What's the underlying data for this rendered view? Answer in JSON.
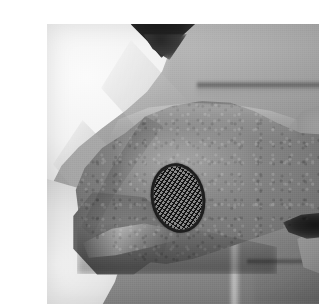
{
  "document": {
    "kind": "photograph",
    "colorspace": "grayscale",
    "width": 319,
    "height": 305,
    "page_background": "#ffffff",
    "caption": ""
  },
  "photo": {
    "frame": {
      "left": 7,
      "top": 8,
      "width": 303,
      "height": 280,
      "border": "none"
    },
    "subject": "bare arm bent at the elbow, seen from the side, with an oval mesh-patterned patch applied to the skin over the elbow",
    "scene_description": "Close-up black-and-white photograph of a person's bent arm. A white garment sleeve fills the upper-left corner and a light garment area the lower-left. A dark triangular shadow of hair or head appears at the top edge. The background is an out-of-focus light grey wall crossed by two horizontal dark rails and one vertical light post.",
    "tones": {
      "background_light": "#b9b9b9",
      "background_dark": "#7e7e7e",
      "skin_light": "#9d9d9d",
      "skin_mid": "#7a7a7a",
      "skin_dark": "#525252",
      "garment_white": "#fbfbfb",
      "hair_dark": "#1b1b1b"
    },
    "elements": [
      {
        "name": "white-sleeve",
        "label": "White sleeve / garment",
        "region": "upper-left"
      },
      {
        "name": "dark-hair-shadow",
        "label": "Dark hair / head shadow",
        "region": "top-center"
      },
      {
        "name": "arm",
        "label": "Bare upper arm and elbow",
        "region": "center"
      },
      {
        "name": "forearm",
        "label": "Forearm continuing to the right past the elbow crease",
        "region": "right"
      },
      {
        "name": "elbow-crease-shadow",
        "label": "Dark elbow crease shadow",
        "region": "right-of-center"
      },
      {
        "name": "lower-garment",
        "label": "Light garment area",
        "region": "lower-left"
      },
      {
        "name": "background-rail-upper",
        "label": "Upper horizontal background rail",
        "region": "upper-right"
      },
      {
        "name": "background-rail-lower",
        "label": "Lower horizontal background rail",
        "region": "lower-right"
      },
      {
        "name": "background-post",
        "label": "Vertical light background post",
        "region": "lower-center-right"
      }
    ]
  },
  "patch": {
    "label": "Oval mesh patch on skin",
    "shape": "ellipse",
    "center_x": 138,
    "center_y": 182,
    "width": 54,
    "height": 70,
    "rotation_deg": -11,
    "border_color": "#242424",
    "border_width_px": 3,
    "fill_color": "#8a8a8a",
    "pattern": "diagonal cross-hatch mesh / diamond grid",
    "pattern_color": "#141414",
    "pattern_pitch_px": 3.6
  }
}
